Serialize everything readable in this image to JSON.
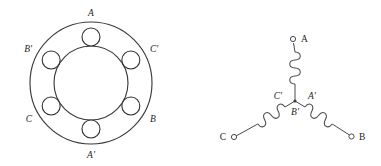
{
  "figure": {
    "background_color": "#ffffff",
    "line_color": "#2b2b2b",
    "width": 381,
    "height": 166
  },
  "stator": {
    "name": "stator-cross-section",
    "description": "Annular stator core with six coil slots arranged at 60 degree intervals",
    "center": {
      "x": 91,
      "y": 83
    },
    "outer_radius": 61,
    "inner_radius": 37,
    "slot_radius": 9,
    "slot_orbit_radius": 46,
    "slot_count": 6,
    "slots": [
      {
        "label": "A",
        "angle_deg": 90,
        "label_x": 91,
        "label_y": 16,
        "anchor": "middle"
      },
      {
        "label": "C'",
        "angle_deg": 30,
        "label_x": 150,
        "label_y": 52,
        "anchor": "start"
      },
      {
        "label": "B",
        "angle_deg": 330,
        "label_x": 150,
        "label_y": 122,
        "anchor": "start"
      },
      {
        "label": "A'",
        "angle_deg": 270,
        "label_x": 91,
        "label_y": 158,
        "anchor": "middle"
      },
      {
        "label": "C",
        "angle_deg": 210,
        "label_x": 32,
        "label_y": 122,
        "anchor": "end"
      },
      {
        "label": "B'",
        "angle_deg": 150,
        "label_x": 32,
        "label_y": 52,
        "anchor": "end"
      }
    ]
  },
  "wye": {
    "name": "wye-connection-diagram",
    "description": "Three phase windings joined at a common neutral point forming a Y",
    "neutral_point": {
      "x": 295,
      "y": 101
    },
    "neutral_labels": [
      {
        "label": "C'",
        "x": 282,
        "y": 99,
        "anchor": "end"
      },
      {
        "label": "A'",
        "x": 308,
        "y": 99,
        "anchor": "start"
      },
      {
        "label": "B'",
        "x": 295,
        "y": 114,
        "anchor": "middle"
      }
    ],
    "branches": [
      {
        "phase": "A",
        "terminal_label": "A",
        "terminal": {
          "x": 293,
          "y": 39
        },
        "label_pos": {
          "x": 301,
          "y": 41,
          "anchor": "start"
        },
        "coil_turns": 4
      },
      {
        "phase": "B",
        "terminal_label": "B",
        "terminal": {
          "x": 351,
          "y": 137
        },
        "label_pos": {
          "x": 359,
          "y": 140,
          "anchor": "start"
        },
        "coil_turns": 4
      },
      {
        "phase": "C",
        "terminal_label": "C",
        "terminal": {
          "x": 234,
          "y": 137
        },
        "label_pos": {
          "x": 226,
          "y": 140,
          "anchor": "end"
        },
        "coil_turns": 4
      }
    ]
  }
}
